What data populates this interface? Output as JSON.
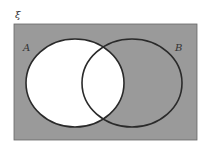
{
  "diagram": {
    "type": "venn",
    "universal_label": "ξ",
    "sets": [
      {
        "name": "A",
        "label": "A"
      },
      {
        "name": "B",
        "label": "B"
      }
    ],
    "shaded_region": "complement of A (A')",
    "colors": {
      "shade": "#9a9a9a",
      "unshaded": "#ffffff",
      "stroke": "#2a2a2a"
    }
  }
}
